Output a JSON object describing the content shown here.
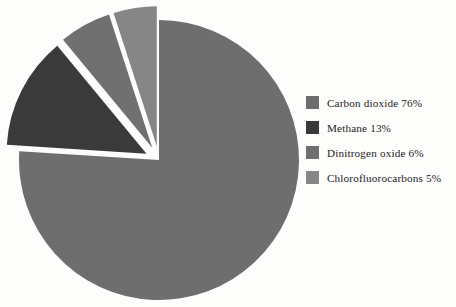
{
  "chart_data": {
    "type": "pie",
    "title": "",
    "subtitle": "",
    "xlabel": "",
    "ylabel": "",
    "legend_position": "right",
    "grid": false,
    "exploded": true,
    "categories": [
      "Carbon dioxide",
      "Methane",
      "Dinitrogen oxide",
      "Chlorofluorocarbons"
    ],
    "values": [
      76,
      13,
      6,
      5
    ],
    "value_unit": "%",
    "labels": [
      "Carbon dioxide 76%",
      "Methane 13%",
      "Dinitrogen oxide 6%",
      "Chlorofluorocarbons 5%"
    ],
    "colors": [
      "#6e6e6e",
      "#3a3a3a",
      "#707070",
      "#868686"
    ],
    "slices": [
      {
        "name": "Carbon dioxide",
        "value": 76,
        "label": "Carbon dioxide 76%",
        "color": "#6e6e6e",
        "start_angle": 0,
        "end_angle": 273.6,
        "exploded": false,
        "explode_offset": 0
      },
      {
        "name": "Methane",
        "value": 13,
        "label": "Methane 13%",
        "color": "#3a3a3a",
        "start_angle": 273.6,
        "end_angle": 320.4,
        "exploded": true,
        "explode_offset": 14
      },
      {
        "name": "Dinitrogen oxide",
        "value": 6,
        "label": "Dinitrogen oxide 6%",
        "color": "#707070",
        "start_angle": 320.4,
        "end_angle": 342.0,
        "exploded": true,
        "explode_offset": 14
      },
      {
        "name": "Chlorofluorocarbons",
        "value": 5,
        "label": "Chlorofluorocarbons 5%",
        "color": "#868686",
        "start_angle": 342.0,
        "end_angle": 360.0,
        "exploded": true,
        "explode_offset": 14
      }
    ]
  },
  "legend": {
    "items": [
      {
        "label": "Carbon dioxide 76%",
        "color": "#6e6e6e"
      },
      {
        "label": "Methane 13%",
        "color": "#3a3a3a"
      },
      {
        "label": "Dinitrogen oxide 6%",
        "color": "#707070"
      },
      {
        "label": "Chlorofluorocarbons 5%",
        "color": "#868686"
      }
    ]
  }
}
